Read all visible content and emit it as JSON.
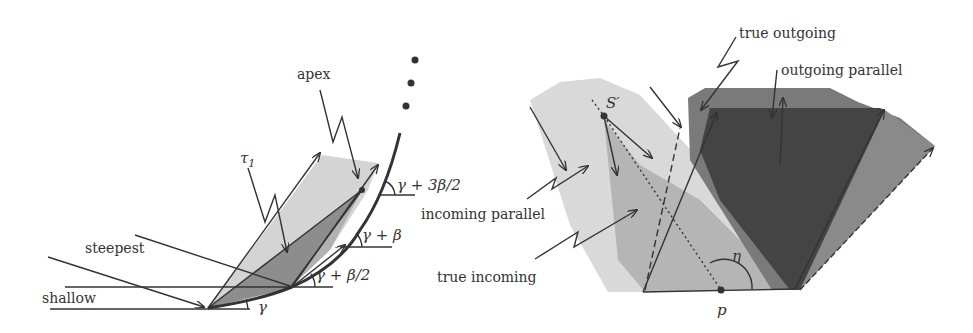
{
  "figure": {
    "left_panel": {
      "labels": {
        "apex": "apex",
        "tau1": "τ",
        "tau1_sub": "1",
        "steepest": "steepest",
        "shallow": "shallow",
        "angle_gamma": "γ",
        "angle_gamma_beta_half": "γ + β/2",
        "angle_gamma_beta": "γ + β",
        "angle_gamma_3beta_half": "γ + 3β/2"
      },
      "ellipsis_dots": 3
    },
    "right_panel": {
      "labels": {
        "true_outgoing": "true outgoing",
        "outgoing_parallel": "outgoing parallel",
        "incoming_parallel": "incoming parallel",
        "true_incoming": "true incoming",
        "s_prime": "S′",
        "eta": "η",
        "p": "p"
      }
    },
    "colors": {
      "light_gray": "#d9d9d9",
      "mid_gray": "#b3b3b3",
      "dark_gray": "#5e5e5e",
      "darker_gray": "#444444",
      "stroke": "#333333"
    }
  }
}
